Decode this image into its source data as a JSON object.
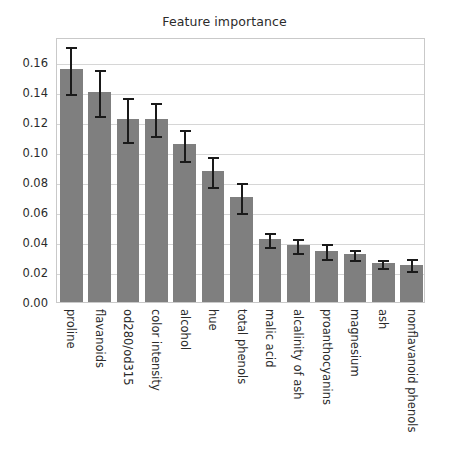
{
  "chart_data": {
    "type": "bar",
    "title": "Feature importance",
    "xlabel": "",
    "ylabel": "",
    "orientation": "vertical",
    "grid": true,
    "grid_axis": "y",
    "legend": false,
    "legend_position": "none",
    "bar_color": "#7f7f7f",
    "error_color": "#1a1a1a",
    "background_color": "#ffffff",
    "axes_edge_color": "#c9c9c9",
    "xtick_rotation": 90,
    "ylim": [
      0.0,
      0.1766
    ],
    "yticks": [
      "0.00",
      "0.02",
      "0.04",
      "0.06",
      "0.08",
      "0.10",
      "0.12",
      "0.14",
      "0.16"
    ],
    "ytick_values": [
      0.0,
      0.02,
      0.04,
      0.06,
      0.08,
      0.1,
      0.12,
      0.14,
      0.16
    ],
    "categories": [
      "proline",
      "flavanoids",
      "od280/od315",
      "color intensity",
      "alcohol",
      "hue",
      "total phenols",
      "malic acid",
      "alcalinity of ash",
      "proanthocyanins",
      "magnesium",
      "ash",
      "nonflavanoid phenols"
    ],
    "values": [
      0.155,
      0.14,
      0.122,
      0.122,
      0.105,
      0.087,
      0.07,
      0.042,
      0.038,
      0.034,
      0.032,
      0.026,
      0.025
    ],
    "errors": [
      0.0155,
      0.0155,
      0.0145,
      0.011,
      0.0105,
      0.01,
      0.01,
      0.0045,
      0.0045,
      0.005,
      0.0035,
      0.0025,
      0.004
    ]
  }
}
